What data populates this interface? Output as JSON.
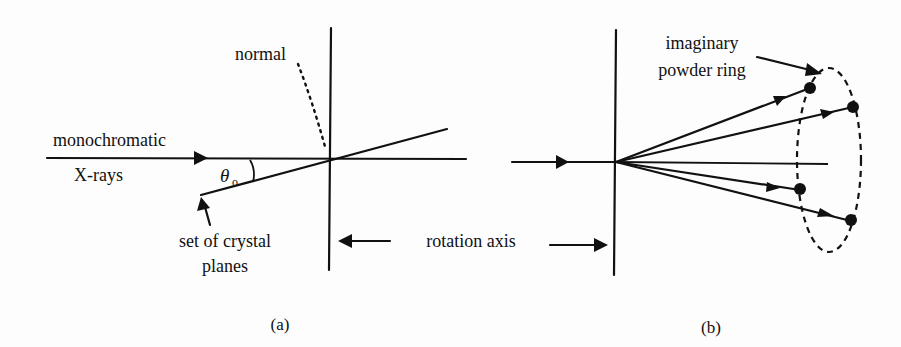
{
  "diagram": {
    "panels": [
      {
        "id": "a",
        "caption": "(a)",
        "labels": {
          "beam_top": "monochromatic",
          "beam_bottom": "X-rays",
          "normal": "normal",
          "angle_symbol": "θ",
          "angle_subscript": "o",
          "planes_line1": "set of crystal",
          "planes_line2": "planes"
        }
      },
      {
        "id": "b",
        "caption": "(b)",
        "labels": {
          "ring_line1": "imaginary",
          "ring_line2": "powder ring"
        },
        "diffracted_rays": 4
      }
    ],
    "shared": {
      "rotation_axis_label": "rotation axis"
    },
    "colors": {
      "ink": "#111111",
      "background": "#fdfdfd"
    }
  }
}
